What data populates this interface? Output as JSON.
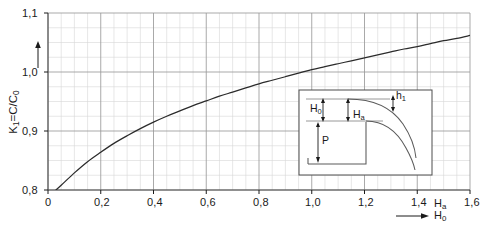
{
  "chart_data": {
    "type": "line",
    "title": "",
    "xlabel": "Ha/H0",
    "ylabel": "K1 = C/C0",
    "xlim": [
      0,
      1.6
    ],
    "ylim": [
      0.8,
      1.1
    ],
    "grid": true,
    "grid_major_x": 0.2,
    "grid_major_y": 0.1,
    "grid_minor_x": 0.05,
    "grid_minor_y": 0.025,
    "legend": "none",
    "x_ticks": [
      "0",
      "0,2",
      "0,4",
      "0,6",
      "0,8",
      "1,0",
      "1,2",
      "1,4",
      "1,6"
    ],
    "x_tick_values": [
      0,
      0.2,
      0.4,
      0.6,
      0.8,
      1.0,
      1.2,
      1.4,
      1.6
    ],
    "y_ticks": [
      "0,8",
      "0,9",
      "1,0",
      "1,1"
    ],
    "y_tick_values": [
      0.8,
      0.9,
      1.0,
      1.1
    ],
    "series": [
      {
        "name": "K1 discharge coefficient ratio",
        "x": [
          0.03,
          0.05,
          0.1,
          0.15,
          0.2,
          0.25,
          0.3,
          0.35,
          0.4,
          0.45,
          0.5,
          0.55,
          0.6,
          0.65,
          0.7,
          0.75,
          0.8,
          0.85,
          0.9,
          0.95,
          1.0,
          1.05,
          1.1,
          1.15,
          1.2,
          1.25,
          1.3,
          1.35,
          1.4,
          1.45,
          1.5,
          1.55,
          1.6
        ],
        "y": [
          0.8,
          0.808,
          0.829,
          0.848,
          0.864,
          0.879,
          0.892,
          0.904,
          0.915,
          0.925,
          0.934,
          0.943,
          0.951,
          0.959,
          0.966,
          0.973,
          0.98,
          0.986,
          0.992,
          0.998,
          1.004,
          1.009,
          1.014,
          1.019,
          1.024,
          1.029,
          1.034,
          1.039,
          1.043,
          1.048,
          1.053,
          1.057,
          1.062
        ]
      }
    ]
  },
  "axes": {
    "y_axis_label_main": "K",
    "y_axis_label_sub": "1",
    "y_axis_label_rest": "=C/C",
    "y_axis_label_rest_sub": "0",
    "x_axis_numerator": "H",
    "x_axis_numerator_sub": "a",
    "x_axis_denominator": "H",
    "x_axis_denominator_sub": "0"
  },
  "inset": {
    "name": "weir-profile-diagram",
    "labels": [
      {
        "id": "h1",
        "text": "h",
        "sub": "1"
      },
      {
        "id": "h0",
        "text": "H",
        "sub": "0"
      },
      {
        "id": "ha",
        "text": "H",
        "sub": "a"
      },
      {
        "id": "p",
        "text": "P",
        "sub": ""
      }
    ]
  }
}
